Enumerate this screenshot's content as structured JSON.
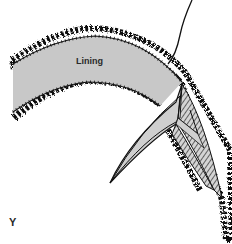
{
  "diagram": {
    "labels": {
      "lining": "Lining",
      "panel": "Y"
    },
    "colors": {
      "lining_fill": "#c8c8c8",
      "outline": "#111111",
      "wedge_fill": "#cfcfcf",
      "background": "#ffffff"
    }
  }
}
